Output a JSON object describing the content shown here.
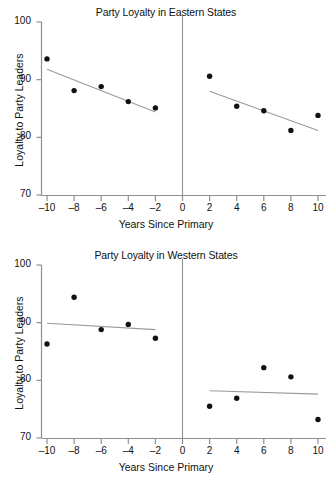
{
  "figure": {
    "width": 332,
    "height": 486,
    "background": "#ffffff",
    "point_color": "#111111",
    "line_color": "#9a9a9a",
    "axis_color": "#8f8f8f"
  },
  "chart_data": [
    {
      "type": "scatter",
      "title": "Party Loyalty in Eastern States",
      "xlabel": "Years Since Primary",
      "ylabel": "Loyalty to Party Leaders",
      "xlim": [
        -11,
        11
      ],
      "ylim": [
        70,
        100
      ],
      "xticks": [
        -10,
        -8,
        -6,
        -4,
        -2,
        0,
        2,
        4,
        6,
        8,
        10
      ],
      "xticklabels": [
        "–10",
        "–8",
        "–6",
        "–4",
        "–2",
        "0",
        "2",
        "4",
        "6",
        "8",
        "10"
      ],
      "yticks": [
        70,
        80,
        90,
        100
      ],
      "yticklabels": [
        "70",
        "80",
        "90",
        "100"
      ],
      "grid": false,
      "legend": "none",
      "vertical_rule_at": 0,
      "series": [
        {
          "name": "Before primary",
          "x": [
            -10,
            -8,
            -6,
            -4,
            -2
          ],
          "values": [
            93.6,
            88.1,
            88.8,
            86.2,
            85.1
          ]
        },
        {
          "name": "After primary",
          "x": [
            2,
            4,
            6,
            8,
            10
          ],
          "values": [
            90.6,
            85.4,
            84.6,
            81.2,
            83.8
          ]
        }
      ],
      "fit_lines": [
        {
          "name": "Left regression line",
          "x": [
            -10,
            -2
          ],
          "y": [
            91.8,
            84.4
          ]
        },
        {
          "name": "Right regression line",
          "x": [
            2,
            10
          ],
          "y": [
            88.0,
            81.2
          ]
        }
      ]
    },
    {
      "type": "scatter",
      "title": "Party Loyalty in Western States",
      "xlabel": "Years Since Primary",
      "ylabel": "Loyalty to Party Leaders",
      "xlim": [
        -11,
        11
      ],
      "ylim": [
        70,
        100
      ],
      "xticks": [
        -10,
        -8,
        -6,
        -4,
        -2,
        0,
        2,
        4,
        6,
        8,
        10
      ],
      "xticklabels": [
        "–10",
        "–8",
        "–6",
        "–4",
        "–2",
        "0",
        "2",
        "4",
        "6",
        "8",
        "10"
      ],
      "yticks": [
        70,
        80,
        90,
        100
      ],
      "yticklabels": [
        "70",
        "80",
        "90",
        "100"
      ],
      "grid": false,
      "legend": "none",
      "vertical_rule_at": 0,
      "series": [
        {
          "name": "Before primary",
          "x": [
            -10,
            -8,
            -6,
            -4,
            -2
          ],
          "values": [
            86.3,
            94.4,
            88.8,
            89.7,
            87.3
          ]
        },
        {
          "name": "After primary",
          "x": [
            2,
            4,
            6,
            8,
            10
          ],
          "values": [
            75.5,
            76.9,
            82.2,
            80.6,
            73.2
          ]
        }
      ],
      "fit_lines": [
        {
          "name": "Left regression line",
          "x": [
            -10,
            -2
          ],
          "y": [
            89.9,
            88.8
          ]
        },
        {
          "name": "Right regression line",
          "x": [
            2,
            10
          ],
          "y": [
            78.2,
            77.6
          ]
        }
      ]
    }
  ]
}
